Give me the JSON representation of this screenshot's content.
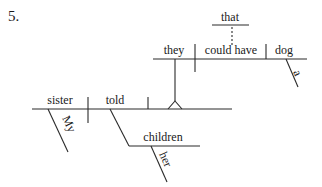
{
  "problem_number": "5.",
  "main_clause": {
    "subject": "sister",
    "subject_modifier": "My",
    "verb": "told",
    "indirect_object": "children",
    "indirect_object_modifier": "her"
  },
  "noun_clause": {
    "conjunction": "that",
    "subject": "they",
    "verb": "could have",
    "direct_object": "dog",
    "direct_object_modifier": "a"
  }
}
